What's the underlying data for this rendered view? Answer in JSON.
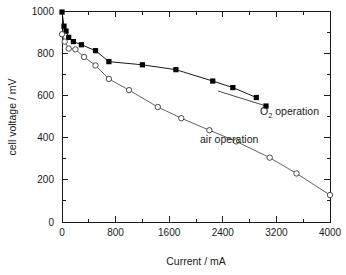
{
  "chart_data": {
    "type": "line",
    "title": "",
    "xlabel": "Current / mA",
    "ylabel": "cell voltage / mV",
    "xlim": [
      0,
      4000
    ],
    "ylim": [
      0,
      1000
    ],
    "xticks": [
      0,
      800,
      1600,
      2400,
      3200,
      4000
    ],
    "xtick_labels": [
      "0",
      "800",
      "1600",
      "2400",
      "3200",
      "4000"
    ],
    "xminor_step": 400,
    "yticks": [
      0,
      200,
      400,
      600,
      800,
      1000
    ],
    "ytick_labels": [
      "0",
      "200",
      "400",
      "600",
      "800",
      "1000"
    ],
    "yminor_step": 100,
    "grid": false,
    "legend_position": "inline-annotations",
    "series": [
      {
        "name": "O2 operation",
        "label_text": "operation",
        "label_prefix": "O",
        "label_subscript": "2",
        "marker": "filled-square",
        "color": "#000000",
        "x": [
          0,
          30,
          60,
          100,
          170,
          290,
          500,
          700,
          1200,
          1700,
          2250,
          2550,
          2900
        ],
        "y": [
          995,
          928,
          905,
          875,
          855,
          840,
          812,
          760,
          745,
          722,
          668,
          637,
          590
        ]
      },
      {
        "name": "air operation",
        "label_text": "air operation",
        "marker": "open-circle",
        "color": "#3a3a3a",
        "x": [
          0,
          40,
          100,
          200,
          330,
          500,
          700,
          1000,
          1430,
          1780,
          2200,
          2600,
          3100,
          3500,
          4000
        ],
        "y": [
          890,
          855,
          822,
          818,
          782,
          742,
          678,
          625,
          545,
          492,
          435,
          382,
          305,
          230,
          128
        ]
      }
    ]
  },
  "annotations": {
    "o2_label_x": 278,
    "o2_label_y": 115,
    "air_label_x": 200,
    "air_label_y": 143
  }
}
